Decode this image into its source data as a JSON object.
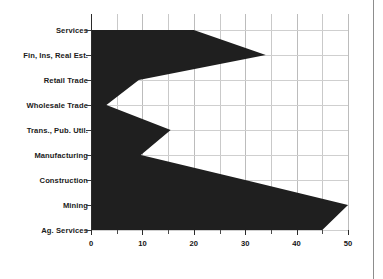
{
  "chart_data": {
    "type": "area",
    "title": "",
    "subtitle": "",
    "xlabel": "",
    "ylabel": "",
    "orientation": "horizontal",
    "xlim": [
      0,
      50
    ],
    "grid": true,
    "legend": null,
    "fill_color": "#1f1f1f",
    "axis_color": "#2b2b2b",
    "grid_color": "#c9c9c9",
    "background_color": "#ffffff",
    "categories": [
      "Services",
      "Fin, Ins, Real Est.",
      "Retail Trade",
      "Wholesale Trade",
      "Trans., Pub. Util.",
      "Manufacturing",
      "Construction",
      "Mining",
      "Ag. Services"
    ],
    "values": [
      20,
      34,
      9.3,
      3,
      15.5,
      9.7,
      30,
      50,
      45
    ],
    "xticks": [
      0,
      10,
      20,
      30,
      40,
      50
    ],
    "xtick_labels": [
      "0",
      "10",
      "20",
      "30",
      "40",
      "50"
    ],
    "xminor_ticks": [
      5,
      15,
      25,
      35,
      45
    ]
  }
}
